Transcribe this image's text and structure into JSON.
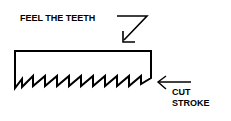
{
  "diagram": {
    "labels": {
      "feel_the_teeth": "FEEL THE TEETH",
      "cut": "CUT",
      "stroke": "STROKE"
    },
    "colors": {
      "stroke": "#000000",
      "background": "#ffffff"
    },
    "teeth_count": 10
  }
}
